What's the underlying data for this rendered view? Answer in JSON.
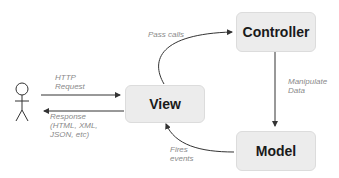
{
  "diagram": {
    "nodes": {
      "view": "View",
      "controller": "Controller",
      "model": "Model",
      "actor": "user-stick-figure"
    },
    "edges": {
      "http_request": [
        "HTTP",
        "Request"
      ],
      "response": [
        "Response",
        "(HTML, XML,",
        "JSON, etc)"
      ],
      "pass_calls": "Pass calls",
      "manipulate_data": [
        "Manipulate",
        "Data"
      ],
      "fires_events": [
        "Fires",
        "events"
      ]
    },
    "colors": {
      "box_fill": "#ececec",
      "box_border": "#dcdcdc",
      "arrow": "#333333",
      "label": "#8a8a8a"
    }
  }
}
